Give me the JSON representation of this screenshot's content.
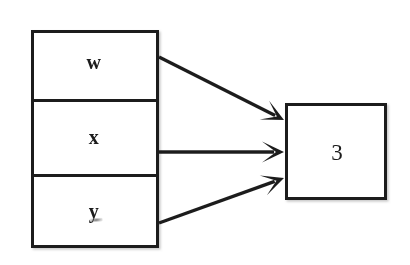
{
  "diagram": {
    "background_color": "#ffffff",
    "stroke_color": "#1f1f1f",
    "text_color": "#1c1c1c",
    "stroke_width": 3,
    "input_group": {
      "name": "input-stack",
      "x": 31,
      "y": 30,
      "width": 128,
      "height": 218,
      "cells": [
        {
          "label": "w",
          "cx": 94,
          "cy": 62
        },
        {
          "label": "x",
          "cx": 94,
          "cy": 137
        },
        {
          "label": "y",
          "cx": 94,
          "cy": 211
        }
      ],
      "divider_y": [
        100,
        175
      ]
    },
    "output_node": {
      "name": "output-node",
      "label": "3",
      "x": 285,
      "y": 103,
      "width": 102,
      "height": 97,
      "cx": 337,
      "cy": 152
    },
    "arrows": [
      {
        "from_label": "w",
        "to_label": "3",
        "x1": 159,
        "y1": 57,
        "x2": 284,
        "y2": 120
      },
      {
        "from_label": "x",
        "to_label": "3",
        "x1": 159,
        "y1": 152,
        "x2": 284,
        "y2": 152
      },
      {
        "from_label": "y",
        "to_label": "3",
        "x1": 159,
        "y1": 223,
        "x2": 284,
        "y2": 178
      }
    ],
    "artifacts": [
      {
        "name": "scan-smudge",
        "cx": 96,
        "cy": 220
      }
    ]
  }
}
